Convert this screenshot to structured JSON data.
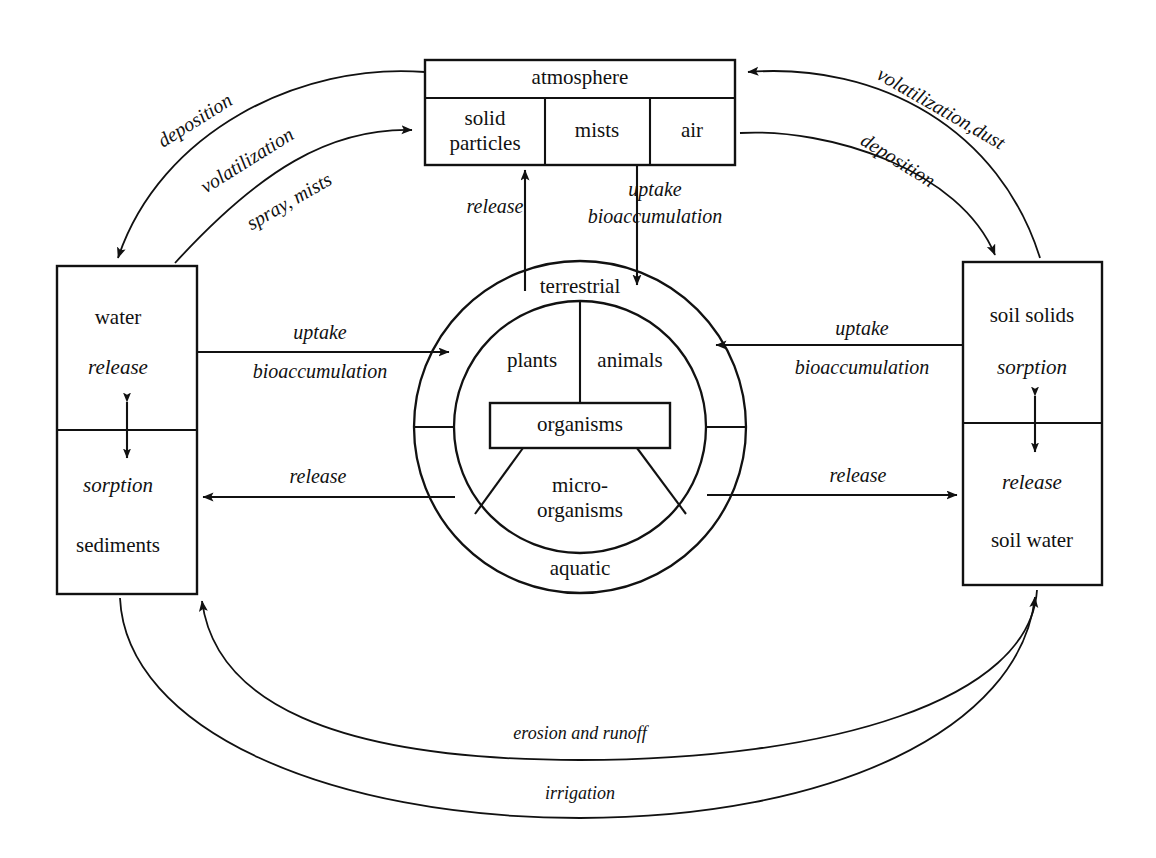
{
  "diagram": {
    "ink_color": "#111111",
    "background_color": "#ffffff",
    "nodes": {
      "atmosphere": {
        "header": "atmosphere",
        "cells": [
          "solid particles",
          "mists",
          "air"
        ],
        "cell_1_line_1": "solid",
        "cell_1_line_2": "particles",
        "cell_2": "mists",
        "cell_3": "air"
      },
      "water_left": {
        "top_label": "water",
        "top_process": "release",
        "bottom_process": "sorption",
        "bottom_label": "sediments"
      },
      "soil_right": {
        "top_label": "soil solids",
        "top_process": "sorption",
        "bottom_process": "release",
        "bottom_label": "soil water"
      },
      "organisms": {
        "outer_top": "terrestrial",
        "outer_bottom": "aquatic",
        "inner_left": "plants",
        "inner_right": "animals",
        "inner_bottom_line_1": "micro-",
        "inner_bottom_line_2": "organisms",
        "center_box": "organisms"
      }
    },
    "flows": {
      "deposition_to_water": "deposition",
      "volatilization_from_water_line_1": "volatilization",
      "volatilization_from_water_line_2": "spray, mists",
      "volatilization_dust_from_soil": "volatilization,dust",
      "deposition_to_soil": "deposition",
      "release_to_atmosphere": "release",
      "uptake_from_atmosphere_line_1": "uptake",
      "uptake_from_atmosphere_line_2": "bioaccumulation",
      "uptake_from_water_line_1": "uptake",
      "uptake_from_water_line_2": "bioaccumulation",
      "release_to_water": "release",
      "uptake_from_soil_line_1": "uptake",
      "uptake_from_soil_line_2": "bioaccumulation",
      "release_to_soil": "release",
      "erosion_and_runoff": "erosion and runoff",
      "irrigation": "irrigation"
    }
  }
}
